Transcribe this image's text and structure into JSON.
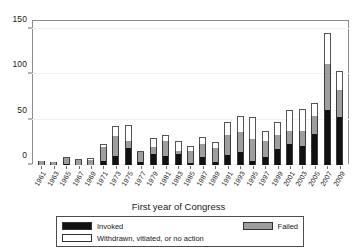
{
  "chart_data": {
    "type": "bar",
    "subtype": "stacked-bar",
    "title": "",
    "xlabel": "First year of Congress",
    "ylabel": "",
    "ylim": [
      0,
      160
    ],
    "yticks": [
      0,
      50,
      100,
      150
    ],
    "grid": false,
    "legend_position": "below-axis",
    "categories": [
      "1961",
      "1963",
      "1965",
      "1967",
      "1969",
      "1971",
      "1973",
      "1975",
      "1977",
      "1979",
      "1981",
      "1983",
      "1985",
      "1987",
      "1989",
      "1991",
      "1993",
      "1995",
      "1997",
      "1999",
      "2001",
      "2003",
      "2005",
      "2007",
      "2009"
    ],
    "series": [
      {
        "name": "Invoked",
        "color": "#111111",
        "values": [
          0,
          0,
          1,
          0,
          0,
          4,
          10,
          19,
          3,
          12,
          10,
          12,
          2,
          9,
          3,
          11,
          14,
          4,
          9,
          18,
          23,
          21,
          34,
          61,
          53
        ]
      },
      {
        "name": "Failed",
        "color": "#9e9e9e",
        "values": [
          4,
          3,
          6,
          5,
          6,
          16,
          22,
          8,
          11,
          8,
          17,
          3,
          14,
          14,
          16,
          22,
          22,
          25,
          18,
          15,
          15,
          16,
          20,
          51,
          30
        ]
      },
      {
        "name": "Withdrawn, vitiated, or no action",
        "color": "#ffffff",
        "values": [
          0,
          0,
          1,
          1,
          1,
          3,
          11,
          17,
          1,
          10,
          6,
          12,
          5,
          8,
          6,
          14,
          18,
          24,
          10,
          15,
          23,
          25,
          14,
          34,
          21
        ]
      }
    ],
    "totals": [
      4,
      3,
      8,
      6,
      7,
      23,
      43,
      44,
      15,
      30,
      33,
      27,
      21,
      31,
      25,
      47,
      54,
      53,
      37,
      48,
      61,
      62,
      68,
      146,
      104
    ]
  },
  "axis": {
    "y_ticks": [
      "0",
      "50",
      "100",
      "150"
    ],
    "x_title": "First year of Congress"
  },
  "legend": {
    "invoked_label": "Invoked",
    "failed_label": "Failed",
    "withdrawn_label": "Withdrawn, vitiated, or no action"
  }
}
